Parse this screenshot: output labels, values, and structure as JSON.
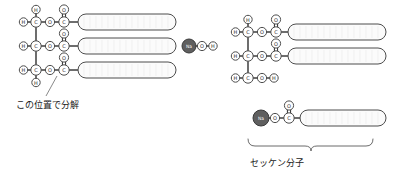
{
  "figure": {
    "title_text_left": "この位置で分解",
    "title_text_right": "セッケン分子",
    "reaction": "triglyceride + NaOH -> glycerol + soap (saponification)"
  },
  "atoms": {
    "H": "H",
    "C": "C",
    "O": "O",
    "Na": "Na"
  },
  "left_molecule": {
    "name": "triglyceride",
    "backbone": [
      {
        "id": "c-top",
        "label": "C"
      },
      {
        "id": "c-middle",
        "label": "C"
      },
      {
        "id": "c-bottom",
        "label": "C"
      }
    ],
    "hydrogens": [
      {
        "id": "h-top-up",
        "label": "H"
      },
      {
        "id": "h-top-left",
        "label": "H"
      },
      {
        "id": "h-middle-left",
        "label": "H"
      },
      {
        "id": "h-bottom-left",
        "label": "H"
      },
      {
        "id": "h-bottom-down",
        "label": "H"
      }
    ],
    "ester_rows": [
      {
        "ester_o": "O",
        "carbonyl_c": "C",
        "carbonyl_o": "O",
        "chain": "fatty-acid-chain"
      },
      {
        "ester_o": "O",
        "carbonyl_c": "C",
        "carbonyl_o": "O",
        "chain": "fatty-acid-chain"
      },
      {
        "ester_o": "O",
        "carbonyl_c": "C",
        "carbonyl_o": "O",
        "chain": "fatty-acid-chain"
      }
    ]
  },
  "reagent": {
    "name": "sodium-hydroxide",
    "atoms": [
      {
        "id": "na",
        "label": "Na"
      },
      {
        "id": "o",
        "label": "O"
      },
      {
        "id": "h",
        "label": "H"
      }
    ]
  },
  "right_molecule": {
    "name": "glycerol-partial",
    "backbone": [
      {
        "id": "c-top",
        "label": "C"
      },
      {
        "id": "c-middle",
        "label": "C"
      },
      {
        "id": "c-bottom",
        "label": "C"
      }
    ],
    "hydrogens": [
      {
        "id": "h-top-up",
        "label": "H"
      },
      {
        "id": "h-top-left",
        "label": "H"
      },
      {
        "id": "h-middle-left",
        "label": "H"
      },
      {
        "id": "h-bottom-left",
        "label": "H"
      },
      {
        "id": "h-bottom-right",
        "label": "H"
      }
    ],
    "ester_rows": [
      {
        "ester_o": "O",
        "carbonyl_c": "C",
        "carbonyl_o": "O",
        "chain": "fatty-acid-chain"
      },
      {
        "ester_o": "O",
        "carbonyl_c": "C",
        "carbonyl_o": "O",
        "chain": "fatty-acid-chain"
      }
    ],
    "free_hydroxyl": {
      "o": "O",
      "h": "H"
    }
  },
  "soap_molecule": {
    "name": "soap",
    "atoms": [
      {
        "id": "na",
        "label": "Na"
      },
      {
        "id": "o-ionic",
        "label": "O"
      },
      {
        "id": "c-carbonyl",
        "label": "C"
      },
      {
        "id": "o-carbonyl",
        "label": "O"
      }
    ],
    "chain": "fatty-acid-chain",
    "caption": "セッケン分子"
  },
  "annotation": {
    "cleavage_note": "この位置で分解"
  },
  "colors": {
    "background": "#ffffff",
    "atom_fill": "#ffffff",
    "atom_stroke": "#4d4d4d",
    "metal_fill": "#5f5f5f",
    "bond": "#1f1f1f",
    "chain_fill": "#fbfbfb",
    "text": "#1a1a1a"
  }
}
